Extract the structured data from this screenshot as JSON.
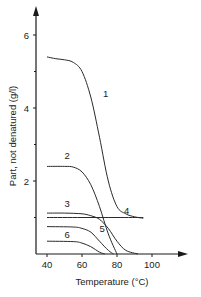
{
  "chart_data": {
    "type": "line",
    "title": "",
    "xlabel": "Temperature (°C)",
    "ylabel": "Part, not denatured (g/l)",
    "xlim": [
      35,
      115
    ],
    "ylim": [
      0,
      7
    ],
    "x_ticks": [
      40,
      60,
      80,
      100
    ],
    "y_ticks": [
      2,
      4,
      6
    ],
    "y_minor_ticks": [
      1,
      3,
      5
    ],
    "grid": false,
    "legend": "inline curve numbers",
    "series": [
      {
        "name": "1",
        "x": [
          40,
          45,
          50,
          55,
          60,
          65,
          70,
          75,
          80,
          85,
          90,
          95
        ],
        "values": [
          5.4,
          5.35,
          5.32,
          5.25,
          5.0,
          4.3,
          3.2,
          2.0,
          1.3,
          1.1,
          1.02,
          0.98
        ]
      },
      {
        "name": "2",
        "x": [
          40,
          50,
          55,
          60,
          65,
          70,
          75,
          80
        ],
        "values": [
          2.4,
          2.4,
          2.38,
          2.25,
          1.9,
          1.3,
          0.55,
          0.0
        ]
      },
      {
        "name": "3",
        "x": [
          40,
          50,
          60,
          65,
          70,
          75,
          80,
          85,
          92
        ],
        "values": [
          1.12,
          1.12,
          1.1,
          1.05,
          0.95,
          0.7,
          0.35,
          0.1,
          0.0
        ]
      },
      {
        "name": "4",
        "x": [
          40,
          60,
          80,
          95
        ],
        "values": [
          1.0,
          1.0,
          1.0,
          1.0
        ]
      },
      {
        "name": "5",
        "x": [
          40,
          55,
          60,
          65,
          70,
          75,
          78
        ],
        "values": [
          0.75,
          0.74,
          0.7,
          0.6,
          0.35,
          0.1,
          0.0
        ]
      },
      {
        "name": "6",
        "x": [
          40,
          55,
          60,
          65,
          70,
          73
        ],
        "values": [
          0.35,
          0.34,
          0.3,
          0.2,
          0.05,
          0.0
        ]
      }
    ],
    "labels": [
      {
        "text": "1",
        "x": 72,
        "y": 4.3
      },
      {
        "text": "2",
        "x": 50,
        "y": 2.6
      },
      {
        "text": "3",
        "x": 50,
        "y": 1.3
      },
      {
        "text": "4",
        "x": 84,
        "y": 1.1
      },
      {
        "text": "5",
        "x": 70,
        "y": 0.6
      },
      {
        "text": "6",
        "x": 50,
        "y": 0.45
      }
    ]
  },
  "axis_text": {
    "xlabel": "Temperature (°C)",
    "ylabel": "Part, not denatured (g/l)"
  },
  "colors": {
    "line": "#2a2a2a",
    "axis": "#1a1a1a",
    "text": "#222222"
  }
}
